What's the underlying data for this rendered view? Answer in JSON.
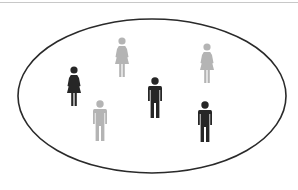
{
  "diagram": {
    "ellipse": {
      "cx": 152,
      "cy": 96,
      "rx": 134,
      "ry": 77,
      "stroke": "#2a2a2a"
    },
    "colors": {
      "dark": "#262626",
      "light": "#b4b4b4",
      "rule": "#c8c8c8"
    },
    "figures": [
      {
        "id": "woman-dark",
        "type": "female",
        "shade": "dark",
        "x": 74,
        "y": 70
      },
      {
        "id": "woman-light-1",
        "type": "female",
        "shade": "light",
        "x": 122,
        "y": 41
      },
      {
        "id": "woman-light-2",
        "type": "female",
        "shade": "light",
        "x": 207,
        "y": 47
      },
      {
        "id": "man-dark-1",
        "type": "male",
        "shade": "dark",
        "x": 155,
        "y": 81
      },
      {
        "id": "man-light",
        "type": "male",
        "shade": "light",
        "x": 100,
        "y": 104
      },
      {
        "id": "man-dark-2",
        "type": "male",
        "shade": "dark",
        "x": 205,
        "y": 105
      }
    ],
    "counts": {
      "total": 6,
      "female": 3,
      "male": 3,
      "dark": 3,
      "light": 3
    }
  }
}
